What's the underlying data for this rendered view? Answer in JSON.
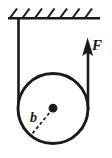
{
  "figure": {
    "name": "pulley-tension-free-body-diagram",
    "background_color": "#ffffff",
    "line_color": "#1a1a1a"
  },
  "labels": {
    "force": "F",
    "radius": "b"
  },
  "ceiling": {
    "name": "fixed-support-ceiling",
    "hatch_count": 7,
    "line_y": 18,
    "line_x_start": 8,
    "line_x_end": 100
  },
  "pulley": {
    "name": "pulley-circle",
    "center_x": 53,
    "center_y": 108.5,
    "radius": 36,
    "center_dot_radius": 4.2
  },
  "cables": {
    "left": {
      "x": 18.5,
      "y_top": 18,
      "y_bottom": 108.5
    },
    "right": {
      "x": 88,
      "y_top": 42,
      "y_bottom": 108.5
    }
  },
  "force_arrow": {
    "name": "force-arrow-F",
    "tip_x": 87.5,
    "tip_y": 38,
    "direction": "up"
  },
  "radius_marker": {
    "name": "radius-dashed-line",
    "from_x": 53,
    "from_y": 108.5,
    "to_x": 30,
    "to_y": 136
  }
}
